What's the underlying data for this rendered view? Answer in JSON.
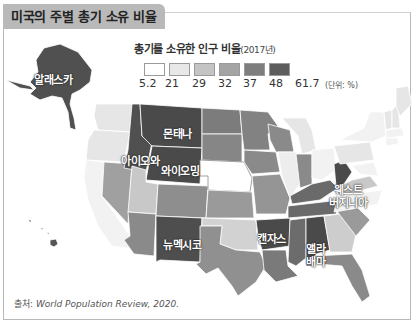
{
  "title": "미국의 주별 총기 소유 비율",
  "legend": {
    "title": "총기를 소유한 인구 비율",
    "year": "(2017년)",
    "colors": [
      "#ffffff",
      "#e8e8e8",
      "#c4c4c4",
      "#a4a4a4",
      "#7e7e7e",
      "#5d5d5d"
    ],
    "ticks": [
      "5.2",
      "21",
      "29",
      "32",
      "37",
      "48",
      "61.7"
    ],
    "unit": "(단위: %)"
  },
  "map_labels": {
    "alaska": "알래스카",
    "montana": "몬태나",
    "idaho": "아이오와",
    "wyoming": "와이오밍",
    "new_mexico": "뉴멕시코",
    "arkansas": "캔자스",
    "west_virginia_1": "웨스트",
    "west_virginia_2": "버지니아",
    "alabama_1": "앨라",
    "alabama_2": "배마"
  },
  "source": {
    "prefix": "출처:",
    "text": "World Population Review, 2020."
  }
}
